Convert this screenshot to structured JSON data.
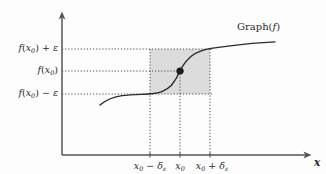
{
  "figure": {
    "kind": "epsilon-delta-continuity-diagram",
    "background_color": "#fdfdfd",
    "ink_color": "#2b2b2b",
    "shade_color": "#c8c8c8",
    "curve_label": "Graph(",
    "curve_label_fn": "f",
    "curve_label_close": ")",
    "x_axis_name": "x"
  },
  "y_labels": [
    {
      "id": "f-x0-plus-eps",
      "prefix": "f",
      "open": "(",
      "var": "x",
      "sub": "0",
      "close": ")",
      "op": " + ",
      "eps": "ε",
      "value_y": 49
    },
    {
      "id": "f-x0",
      "prefix": "f",
      "open": "(",
      "var": "x",
      "sub": "0",
      "close": ")",
      "op": "",
      "eps": "",
      "value_y": 71
    },
    {
      "id": "f-x0-minus-eps",
      "prefix": "f",
      "open": "(",
      "var": "x",
      "sub": "0",
      "close": ")",
      "op": " − ",
      "eps": "ε",
      "value_y": 94
    }
  ],
  "x_labels": [
    {
      "id": "x0-minus-delta",
      "var": "x",
      "sub": "0",
      "op": " − ",
      "sym": "δ",
      "symsub": "ε",
      "value_x": 150
    },
    {
      "id": "x0",
      "var": "x",
      "sub": "0",
      "op": "",
      "sym": "",
      "symsub": "",
      "value_x": 180
    },
    {
      "id": "x0-plus-delta",
      "var": "x",
      "sub": "0",
      "op": " + ",
      "sym": "δ",
      "symsub": "ε",
      "value_x": 210
    }
  ],
  "chart_data": {
    "type": "line",
    "title": "",
    "xlabel": "x",
    "ylabel": "",
    "grid": false,
    "legend": "none",
    "axes": {
      "origin_px": [
        62,
        155
      ],
      "y_axis_x_px": 62,
      "x_axis_y_px": 155,
      "x_axis_end_px": 312,
      "y_axis_top_px": 13
    },
    "series": [
      {
        "name": "Graph(f)",
        "description": "smooth increasing sigmoid-like curve passing through (x0, f(x0))",
        "points_px": [
          [
            100,
            105
          ],
          [
            108,
            99
          ],
          [
            117,
            96
          ],
          [
            128,
            95
          ],
          [
            140,
            94.5
          ],
          [
            150,
            94
          ],
          [
            158,
            93
          ],
          [
            166,
            90
          ],
          [
            173,
            83
          ],
          [
            178,
            75
          ],
          [
            180,
            71
          ],
          [
            184,
            65
          ],
          [
            190,
            58
          ],
          [
            197,
            53
          ],
          [
            206,
            50
          ],
          [
            216,
            48
          ],
          [
            230,
            46
          ],
          [
            246,
            44
          ],
          [
            262,
            43
          ],
          [
            275,
            42
          ]
        ]
      }
    ],
    "marked_point": {
      "label": "(x0, f(x0))",
      "x_px": 180,
      "y_px": 71,
      "radius_px": 3.6
    },
    "shaded_region": {
      "name": "epsilon-delta box",
      "x_from_px": 150,
      "x_to_px": 210,
      "y_top_px": 49,
      "y_bottom_px": 94,
      "fill": "#c8c8c8",
      "opacity": 0.62
    },
    "guide_lines": {
      "horizontal_px": [
        49,
        71,
        94
      ],
      "vertical_px": [
        150,
        180,
        210
      ],
      "vertical_bottom_px": 155,
      "style": "dotted"
    },
    "annotations": [
      {
        "text": "Graph(f)",
        "x_px": 237,
        "y_px": 27
      }
    ]
  }
}
